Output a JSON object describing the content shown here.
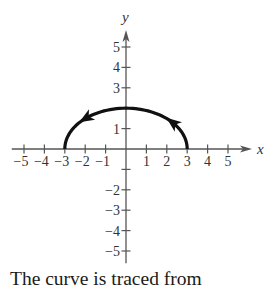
{
  "chart_data": {
    "type": "line",
    "title": "",
    "xlabel": "x",
    "ylabel": "y",
    "xlim": [
      -5,
      5
    ],
    "ylim": [
      -5,
      5
    ],
    "grid": false,
    "x_ticks": [
      -5,
      -4,
      -3,
      -2,
      -1,
      1,
      2,
      3,
      4,
      5
    ],
    "x_tick_labels": [
      "−5",
      "−4",
      "−3",
      "−2",
      "−1",
      "1",
      "2",
      "3",
      "4",
      "5"
    ],
    "y_ticks": [
      5,
      4,
      3,
      2,
      1,
      -1,
      -2,
      -3,
      -4,
      -5
    ],
    "y_tick_labels": [
      {
        "value": 5,
        "label": "5"
      },
      {
        "value": 4,
        "label": "4"
      },
      {
        "value": 3,
        "label": "3"
      },
      {
        "value": 1,
        "label": "1"
      },
      {
        "value": -2,
        "label": "−2"
      },
      {
        "value": -3,
        "label": "−3"
      },
      {
        "value": -4,
        "label": "−4"
      },
      {
        "value": -5,
        "label": "−5"
      }
    ],
    "series": [
      {
        "name": "parametric curve (upper half ellipse x²/9 + y²/4 = 1)",
        "orientation": "counterclockwise from (3,0) to (-3,0)",
        "x": [
          3,
          2.85,
          2.6,
          2.25,
          1.8,
          1.2,
          0.6,
          0,
          -0.6,
          -1.2,
          -1.8,
          -2.25,
          -2.6,
          -2.85,
          -3
        ],
        "y": [
          0,
          0.62,
          1.0,
          1.32,
          1.6,
          1.83,
          1.96,
          2,
          1.96,
          1.83,
          1.6,
          1.32,
          1.0,
          0.62,
          0
        ]
      }
    ],
    "annotations": [
      {
        "type": "arrow",
        "at": [
          2.3,
          1.3
        ],
        "direction": "up-left"
      },
      {
        "type": "arrow",
        "at": [
          -1.6,
          1.7
        ],
        "direction": "left"
      }
    ]
  },
  "axes": {
    "x_label": "x",
    "y_label": "y"
  },
  "caption": {
    "text": "The curve is traced from"
  }
}
